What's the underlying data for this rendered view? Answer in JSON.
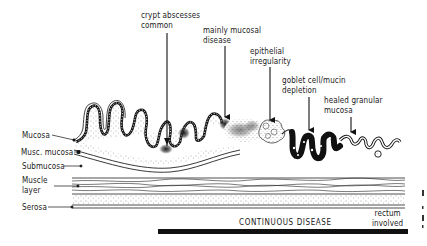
{
  "figure": {
    "type": "histology-schematic",
    "colors": {
      "ink": "#1a1a1a",
      "background": "#ffffff",
      "stipple": "#555555"
    }
  },
  "annotations": [
    {
      "id": "crypt",
      "lines": [
        "crypt abscesses",
        "common"
      ]
    },
    {
      "id": "mucosal",
      "lines": [
        "mainly mucosal",
        "disease"
      ]
    },
    {
      "id": "epithelial",
      "lines": [
        "epithelial",
        "irregularity"
      ]
    },
    {
      "id": "goblet",
      "lines": [
        "goblet cell/mucin",
        "depletion"
      ]
    },
    {
      "id": "healed",
      "lines": [
        "healed granular",
        "mucosa"
      ]
    }
  ],
  "layers": [
    {
      "id": "mucosa",
      "label": "Mucosa"
    },
    {
      "id": "musc_mucosa",
      "label": "Musc. mucosa"
    },
    {
      "id": "submucosa",
      "label": "Submucosa"
    },
    {
      "id": "muscle",
      "lines": [
        "Muscle",
        "layer"
      ]
    },
    {
      "id": "serosa",
      "label": "Serosa"
    }
  ],
  "extent": {
    "disease_label": "CONTINUOUS DISEASE",
    "rectum_lines": [
      "rectum",
      "involved"
    ]
  }
}
